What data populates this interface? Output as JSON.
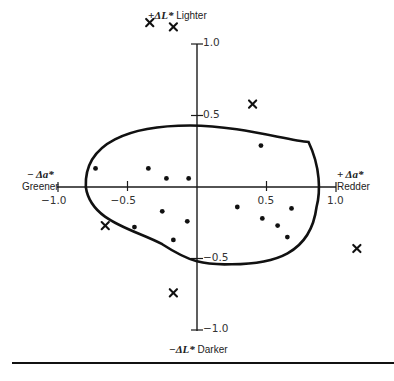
{
  "chart_data": {
    "type": "scatter",
    "title": "",
    "xlabel": "Δa*",
    "ylabel": "ΔL*",
    "xlim": [
      -1.0,
      1.0
    ],
    "ylim": [
      -1.0,
      1.0
    ],
    "grid": false,
    "axes_style": "crosshair through origin",
    "axis_labels": {
      "x_negative": {
        "sign_label": "− Δa*",
        "word": "Greener"
      },
      "x_positive": {
        "sign_label": "+ Δa*",
        "word": "Redder"
      },
      "y_positive": {
        "sign_label": "+ΔL*",
        "word": "Lighter"
      },
      "y_negative": {
        "sign_label": "−ΔL*",
        "word": "Darker"
      }
    },
    "x_ticks": [
      {
        "value": -1.0,
        "label": "−1.0"
      },
      {
        "value": -0.5,
        "label": "−0.5"
      },
      {
        "value": 0.5,
        "label": "0.5"
      },
      {
        "value": 1.0,
        "label": "1.0"
      }
    ],
    "y_ticks": [
      {
        "value": 1.0,
        "label": "1.0"
      },
      {
        "value": 0.5,
        "label": "0.5"
      },
      {
        "value": -0.5,
        "label": "−0.5"
      },
      {
        "value": -1.0,
        "label": "−1.0"
      }
    ],
    "series": [
      {
        "name": "Accepted (inside tolerance)",
        "marker": "dot",
        "points": [
          {
            "a": -0.73,
            "L": 0.13
          },
          {
            "a": -0.35,
            "L": 0.13
          },
          {
            "a": -0.22,
            "L": 0.06
          },
          {
            "a": -0.06,
            "L": 0.06
          },
          {
            "a": 0.46,
            "L": 0.29
          },
          {
            "a": -0.25,
            "L": -0.17
          },
          {
            "a": -0.07,
            "L": -0.24
          },
          {
            "a": -0.45,
            "L": -0.28
          },
          {
            "a": -0.17,
            "L": -0.37
          },
          {
            "a": 0.29,
            "L": -0.14
          },
          {
            "a": 0.68,
            "L": -0.15
          },
          {
            "a": 0.47,
            "L": -0.22
          },
          {
            "a": 0.58,
            "L": -0.27
          },
          {
            "a": 0.65,
            "L": -0.35
          }
        ]
      },
      {
        "name": "Rejected (outside tolerance)",
        "marker": "cross",
        "points": [
          {
            "a": -0.34,
            "L": 1.15
          },
          {
            "a": -0.17,
            "L": 1.12
          },
          {
            "a": 0.4,
            "L": 0.58
          },
          {
            "a": 1.15,
            "L": -0.43
          },
          {
            "a": -0.66,
            "L": -0.27
          },
          {
            "a": -0.17,
            "L": -0.74
          }
        ]
      }
    ],
    "tolerance_boundary": {
      "shape": "egg-shaped ellipse",
      "left": -0.8,
      "right": 0.86,
      "top": 0.43,
      "bottom": -0.54
    }
  }
}
